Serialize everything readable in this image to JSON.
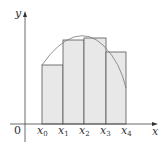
{
  "diagram": {
    "type": "riemann-sum",
    "axes": {
      "x_label": "x",
      "y_label": "y",
      "origin_label": "0"
    },
    "partition_labels": [
      {
        "base": "x",
        "sub": "0"
      },
      {
        "base": "x",
        "sub": "1"
      },
      {
        "base": "x",
        "sub": "2"
      },
      {
        "base": "x",
        "sub": "3"
      },
      {
        "base": "x",
        "sub": "4"
      }
    ],
    "rectangles": [
      {
        "x0": 42,
        "x1": 63,
        "top": 65
      },
      {
        "x0": 63,
        "x1": 84,
        "top": 40
      },
      {
        "x0": 84,
        "x1": 106,
        "top": 38
      },
      {
        "x0": 106,
        "x1": 126,
        "top": 52
      }
    ],
    "colors": {
      "fill": "#e8e8e8",
      "stroke": "#555555",
      "curve": "#777777",
      "axis": "#444444"
    }
  }
}
